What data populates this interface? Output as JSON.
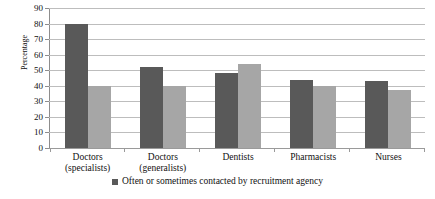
{
  "chart_data": {
    "type": "bar",
    "title": "",
    "xlabel": "",
    "ylabel": "Percentage",
    "ylim": [
      0,
      90
    ],
    "ytick_step": 10,
    "yticks": [
      90,
      80,
      70,
      60,
      50,
      40,
      30,
      20,
      10,
      0
    ],
    "grid": true,
    "legend_position": "bottom",
    "categories": [
      "Doctors (specialists)",
      "Doctors (generalists)",
      "Dentists",
      "Pharmacists",
      "Nurses"
    ],
    "category_lines": [
      {
        "line1": "Doctors",
        "line2": "(specialists)"
      },
      {
        "line1": "Doctors",
        "line2": "(generalists)"
      },
      {
        "line1": "Dentists",
        "line2": ""
      },
      {
        "line1": "Pharmacists",
        "line2": ""
      },
      {
        "line1": "Nurses",
        "line2": ""
      }
    ],
    "series": [
      {
        "name": "Often or sometimes contacted by recruitment agency",
        "color": "#595959",
        "values": [
          80,
          52,
          48,
          44,
          43
        ]
      },
      {
        "name": "",
        "color": "#a6a6a6",
        "values": [
          40,
          40,
          54,
          40,
          37
        ]
      }
    ]
  },
  "legend": {
    "items": [
      {
        "label": "Often or sometimes contacted by recruitment agency",
        "color": "#595959"
      }
    ]
  },
  "colors": {
    "series_dark": "#595959",
    "series_light": "#a6a6a6",
    "gridline": "#bdbdbd",
    "axis": "#8d8d8d",
    "background": "#ffffff",
    "text": "#111111"
  }
}
